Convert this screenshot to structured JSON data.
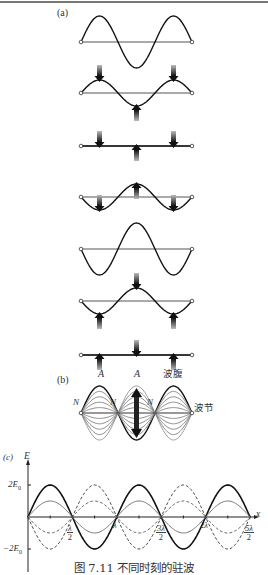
{
  "figure": {
    "caption": "图 7.11   不同时刻的驻波",
    "panels": {
      "a": {
        "label": "(a)",
        "description": "Standing wave snapshots at successive times with velocity arrows",
        "rows": [
          {
            "amplitude": 1.0,
            "arrows": []
          },
          {
            "amplitude": 0.5,
            "arrows": [
              "down",
              "up",
              "down"
            ]
          },
          {
            "amplitude": 0.0,
            "arrows": [
              "down",
              "up",
              "down"
            ]
          },
          {
            "amplitude": -0.5,
            "arrows": [
              "down",
              "up",
              "down"
            ]
          },
          {
            "amplitude": -1.0,
            "arrows": []
          },
          {
            "amplitude": -0.5,
            "arrows": [
              "up",
              "down",
              "up"
            ]
          },
          {
            "amplitude": 0.0,
            "arrows": [
              "up",
              "down",
              "up"
            ]
          }
        ]
      },
      "b": {
        "label": "(b)",
        "antinode_label_A1": "A",
        "antinode_label_A2": "A",
        "antinode_text": "波腹",
        "node_label": "N",
        "node_text": "波节"
      },
      "c": {
        "label": "(c)",
        "y_axis_label": "E",
        "x_axis_label": "x",
        "y_tick_top": "2E",
        "y_tick_top_sub": "0",
        "y_tick_bottom": "−2E",
        "y_tick_bottom_sub": "0",
        "x_ticks": {
          "t1_num": "λ",
          "t1_den": "2",
          "t2": "λ",
          "t3_num": "3λ",
          "t3_den": "2",
          "t4": "2λ",
          "t5_num": "5λ",
          "t5_den": "2"
        }
      }
    }
  }
}
